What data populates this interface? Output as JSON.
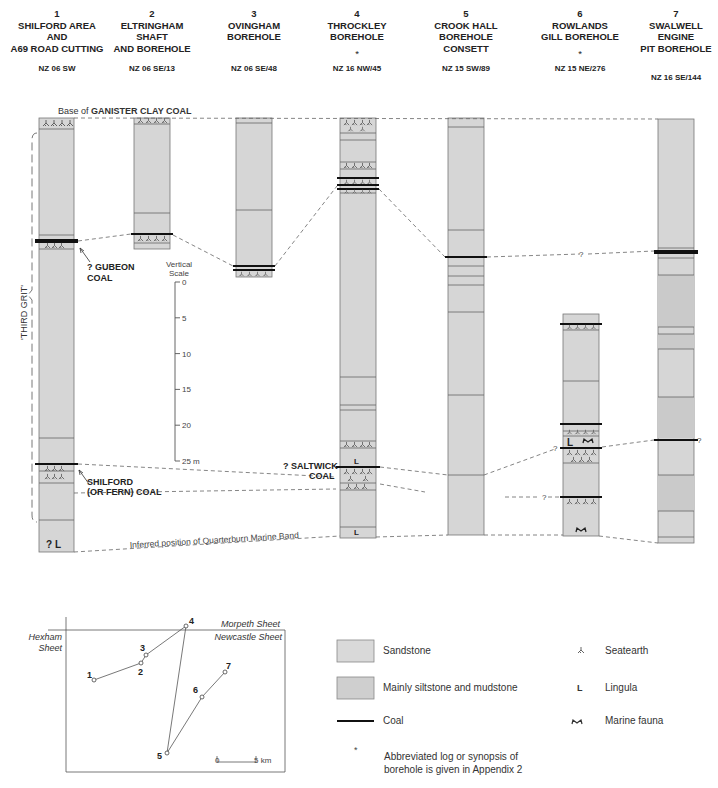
{
  "headers": [
    {
      "num": "1",
      "name": "SHILFORD AREA\nAND\nA69 ROAD CUTTING",
      "star": "",
      "ref": "NZ 06 SW",
      "cx": 57,
      "top_ref": 59
    },
    {
      "num": "2",
      "name": "ELTRINGHAM\nSHAFT\nAND BOREHOLE",
      "star": "",
      "ref": "NZ 06 SE/13",
      "cx": 152,
      "top_ref": 59
    },
    {
      "num": "3",
      "name": "OVINGHAM\nBOREHOLE",
      "star": "",
      "ref": "NZ 06 SE/48",
      "cx": 254,
      "top_ref": 59
    },
    {
      "num": "4",
      "name": "THROCKLEY\nBOREHOLE",
      "star": "*",
      "ref": "NZ 16 NW/45",
      "cx": 357,
      "top_ref": 59
    },
    {
      "num": "5",
      "name": "CROOK HALL\nBOREHOLE\nCONSETT",
      "star": "",
      "ref": "NZ 15 SW/89",
      "cx": 466,
      "top_ref": 59
    },
    {
      "num": "6",
      "name": "ROWLANDS\nGILL BOREHOLE",
      "star": "*",
      "ref": "NZ 15 NE/276",
      "cx": 580,
      "top_ref": 59
    },
    {
      "num": "7",
      "name": "SWALWELL\nENGINE\nPIT BOREHOLE",
      "star": "",
      "ref": "NZ 16 SE/144",
      "cx": 676,
      "top_ref": 68
    }
  ],
  "annotations": {
    "top_marker_prefix": "Base of ",
    "top_marker_bold": "GANISTER CLAY COAL",
    "gubeon_1": "? GUBEON",
    "gubeon_2": "COAL",
    "shilford_1": "SHILFORD",
    "shilford_2": "(OR FERN) COAL",
    "saltwick_1": "? SALTWICK",
    "saltwick_2": "COAL",
    "third_grit": "'THIRD GRIT'",
    "quarterburn": "Inferred position of Quarterburn Marine Band",
    "lingula_query": "? L",
    "query": "?"
  },
  "vertical_scale": {
    "title_1": "Vertical",
    "title_2": "Scale",
    "ticks": [
      "0",
      "5",
      "10",
      "15",
      "20",
      "25 m"
    ]
  },
  "map": {
    "sheets": [
      "Morpeth Sheet",
      "Newcastle Sheet",
      "Hexham",
      "Sheet"
    ],
    "points": [
      {
        "label": "1",
        "x": 94,
        "y": 680
      },
      {
        "label": "2",
        "x": 141,
        "y": 663
      },
      {
        "label": "3",
        "x": 146,
        "y": 655
      },
      {
        "label": "4",
        "x": 186,
        "y": 626
      },
      {
        "label": "5",
        "x": 167,
        "y": 753
      },
      {
        "label": "6",
        "x": 202,
        "y": 697
      },
      {
        "label": "7",
        "x": 225,
        "y": 672
      }
    ],
    "scale_start": "0",
    "scale_end": "5 km"
  },
  "legend": {
    "sandstone": "Sandstone",
    "siltstone": "Mainly siltstone and mudstone",
    "coal": "Coal",
    "seatearth": "Seatearth",
    "lingula": "Lingula",
    "marine": "Marine fauna",
    "star_symbol": "*",
    "star_note_1": "Abbreviated log or synopsis  of",
    "star_note_2": "borehole is given in Appendix 2",
    "lingula_symbol": "L"
  },
  "colors": {
    "sandstone": "#d9d9d9",
    "siltstone": "#cfcfcf",
    "coal": "#111111",
    "line": "#555555"
  }
}
